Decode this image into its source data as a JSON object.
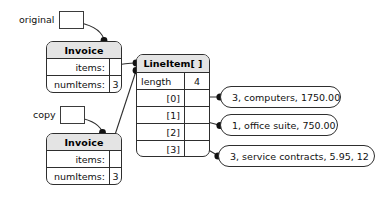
{
  "diagram": {
    "background_color": "#ffffff",
    "line_color": "#2e2e2e",
    "header_fill": "#e4e4e4"
  },
  "references": [
    {
      "id": "original",
      "label": "original",
      "box_icon": "reference-box"
    },
    {
      "id": "copy",
      "label": "copy",
      "box_icon": "reference-box"
    }
  ],
  "objects": [
    {
      "id": "invoice_original",
      "type_name": "Invoice",
      "fields": [
        {
          "name": "items:",
          "value": ""
        },
        {
          "name": "numItems:",
          "value": "3"
        }
      ]
    },
    {
      "id": "invoice_copy",
      "type_name": "Invoice",
      "fields": [
        {
          "name": "items:",
          "value": ""
        },
        {
          "name": "numItems:",
          "value": "3"
        }
      ]
    }
  ],
  "array": {
    "id": "lineitem_array",
    "type_name": "LineItem[ ]",
    "length_label": "length",
    "length_value": "4",
    "slots": [
      {
        "index": "[0]",
        "value": ""
      },
      {
        "index": "[1]",
        "value": ""
      },
      {
        "index": "[2]",
        "value": ""
      },
      {
        "index": "[3]",
        "value": ""
      }
    ]
  },
  "line_items": [
    {
      "id": "item0",
      "label": "3, computers, 1750.00"
    },
    {
      "id": "item1",
      "label": "1, office suite, 750.00"
    },
    {
      "id": "item2",
      "label": "3, service contracts, 5.95, 12"
    }
  ],
  "connections": [
    {
      "from": "original",
      "to": "invoice_original",
      "style": "curve-arrow-dot"
    },
    {
      "from": "copy",
      "to": "invoice_copy",
      "style": "curve-arrow-dot"
    },
    {
      "from": "invoice_original.items",
      "to": "lineitem_array",
      "style": "line-dot"
    },
    {
      "from": "invoice_copy.items",
      "to": "lineitem_array",
      "style": "line-dot"
    },
    {
      "from": "lineitem_array.[0]",
      "to": "item0",
      "style": "line-dot"
    },
    {
      "from": "lineitem_array.[1]",
      "to": "item1",
      "style": "line-dot"
    },
    {
      "from": "lineitem_array.[2]",
      "to": "item2",
      "style": "line-dot"
    }
  ]
}
